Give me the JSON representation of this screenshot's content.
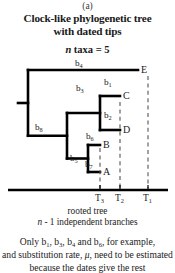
{
  "panel": {
    "letter": "(a)"
  },
  "title": {
    "line1": "Clock-like phylogenetic tree",
    "line2": "with dated tips"
  },
  "taxa": {
    "variable": "n",
    "rest": " taxa = 5"
  },
  "caption": {
    "line1": "rooted tree",
    "line2_var": "n",
    "line2_rest": " - 1 independent branches"
  },
  "note": {
    "line1": "Only b1, b3, b4 and b6, for example,",
    "line1_parts": [
      "Only b",
      "1",
      ", b",
      "3",
      ", b",
      "4",
      " and b",
      "6",
      ", for example,"
    ],
    "line2_a": "and substitution rate, ",
    "line2_mu": "μ",
    "line2_b": ", need to be estimated",
    "line3": "because the dates give the rest"
  },
  "tree": {
    "type": "phylogeny",
    "n_taxa": 5,
    "tips": [
      {
        "name": "E",
        "x": 138,
        "y": 12,
        "time_label": "T1"
      },
      {
        "name": "C",
        "x": 120,
        "y": 38,
        "time_label": "T2"
      },
      {
        "name": "D",
        "x": 120,
        "y": 72,
        "time_label": "T2"
      },
      {
        "name": "B",
        "x": 100,
        "y": 87,
        "time_label": "T3"
      },
      {
        "name": "A",
        "x": 100,
        "y": 114,
        "time_label": "T3"
      }
    ],
    "branch_labels": [
      {
        "id": "b4",
        "sub": "4",
        "x": 75,
        "y": 1
      },
      {
        "id": "b8",
        "sub": "8",
        "x": 35,
        "y": 65
      },
      {
        "id": "b3",
        "sub": "3",
        "x": 76,
        "y": 26
      },
      {
        "id": "b1",
        "sub": "1",
        "x": 104,
        "y": 20
      },
      {
        "id": "b2",
        "sub": "2",
        "x": 104,
        "y": 53
      },
      {
        "id": "b5",
        "sub": "5",
        "x": 70,
        "y": 96
      },
      {
        "id": "b6",
        "sub": "6",
        "x": 86,
        "y": 74
      },
      {
        "id": "b7",
        "sub": "7",
        "x": 85,
        "y": 102
      }
    ],
    "time_axis": {
      "y": 132,
      "x_start": 8,
      "x_end": 168,
      "ticks": [
        {
          "label": "T3",
          "sub": "3",
          "x": 100
        },
        {
          "label": "T2",
          "sub": "2",
          "x": 120
        },
        {
          "label": "T1",
          "sub": "1",
          "x": 148
        }
      ]
    },
    "dashed_lines": [
      {
        "at": "T3",
        "x": 100,
        "y_top": 90,
        "y_bottom": 130
      },
      {
        "at": "T2",
        "x": 120,
        "y_top": 44,
        "y_bottom": 130
      },
      {
        "at": "T1",
        "x": 148,
        "y_top": 18,
        "y_bottom": 130
      }
    ],
    "root": {
      "x": 28,
      "y": 45,
      "stub_x": 18
    },
    "colors": {
      "branch": "#000000",
      "dashed": "#555555",
      "axis": "#000000"
    }
  }
}
